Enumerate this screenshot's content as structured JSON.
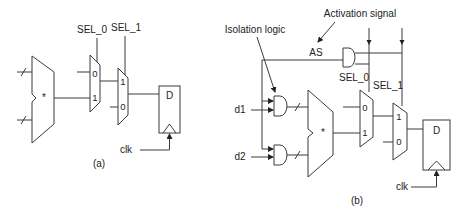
{
  "diagram": {
    "colors": {
      "line": "#3a3a3a",
      "text": "#222222",
      "background": "#ffffff"
    },
    "figure_a": {
      "caption": "(a)",
      "multiplier_symbol": "*",
      "mux0": {
        "select_label": "SEL_0",
        "input_top": "0",
        "input_bottom": "1"
      },
      "mux1": {
        "select_label": "SEL_1",
        "input_top": "1",
        "input_bottom": "0"
      },
      "flipflop": {
        "d_label": "D",
        "clock_label": "clk"
      }
    },
    "figure_b": {
      "caption": "(b)",
      "annotations": {
        "isolation_logic": "Isolation logic",
        "activation_signal": "Activation signal"
      },
      "activation_net_label": "AS",
      "inputs": {
        "d1": "d1",
        "d2": "d2"
      },
      "multiplier_symbol": "*",
      "mux0": {
        "select_label": "SEL_0",
        "input_top": "0",
        "input_bottom": "1"
      },
      "mux1": {
        "select_label": "SEL_1",
        "input_top": "1",
        "input_bottom": "0"
      },
      "flipflop": {
        "d_label": "D",
        "clock_label": "clk"
      }
    }
  }
}
